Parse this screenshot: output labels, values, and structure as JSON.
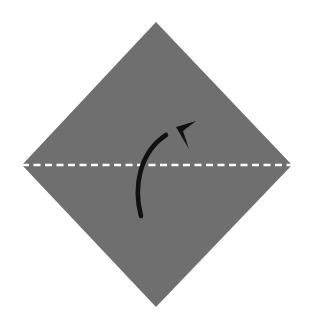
{
  "canvas": {
    "width": 312,
    "height": 328,
    "background_color": "#ffffff",
    "title": "Origami valley fold diagram"
  },
  "figure": {
    "type": "origami-fold-instruction",
    "paper": {
      "shape": "diamond",
      "fill_color": "#6f6f6f",
      "points": "156,22 292,165 156,307 22,165",
      "vertices": {
        "top": [
          156,
          22
        ],
        "right": [
          292,
          165
        ],
        "bottom": [
          156,
          307
        ],
        "left": [
          22,
          165
        ]
      }
    },
    "fold_line": {
      "label": "fold-line",
      "style": "dashed",
      "orientation": "horizontal",
      "color": "#ffffff",
      "stroke_width": 2.6,
      "dash_pattern": "7 4.5",
      "x1": 22,
      "y1": 165,
      "x2": 292,
      "y2": 165
    },
    "fold_arrow": {
      "label": "fold-arrow",
      "color": "#111111",
      "stroke_width": 4.6,
      "direction": "upward-right",
      "path": "M 141,216 C 133,186 140,152 166,135",
      "tail": [
        141,
        216
      ],
      "head_tip": [
        196,
        121
      ],
      "head_points": "196,121 176,127 189,149 183,131"
    }
  }
}
